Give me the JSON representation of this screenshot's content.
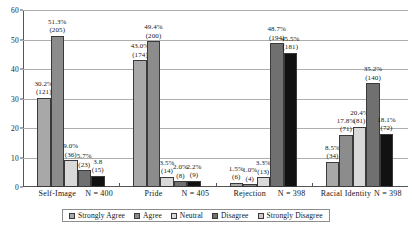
{
  "chart_data": {
    "type": "bar",
    "title": "",
    "subtitle": "",
    "xlabel": "",
    "ylabel": "",
    "ylim": [
      0,
      60
    ],
    "yticks": [
      0,
      10,
      20,
      30,
      40,
      50,
      60
    ],
    "grid": true,
    "legend_position": "bottom",
    "categories": [
      "Self-Image",
      "Pride",
      "Rejection",
      "Racial Identity"
    ],
    "category_n_labels": [
      "N = 400",
      "N = 405",
      "N = 398",
      "N = 398"
    ],
    "series": [
      {
        "name": "Strongly Agree",
        "color": "#a8a8a8",
        "values": [
          30.2,
          43.0,
          1.5,
          8.5
        ],
        "counts": [
          121,
          174,
          6,
          34
        ],
        "labels": [
          "30.2%",
          "43.0%",
          "1.5%",
          "8.5%"
        ],
        "count_labels": [
          "(121)",
          "(174)",
          "(6)",
          "(34)"
        ]
      },
      {
        "name": "Agree",
        "color": "#8c8c8c",
        "values": [
          51.3,
          49.4,
          1.0,
          17.8
        ],
        "counts": [
          205,
          200,
          4,
          71
        ],
        "labels": [
          "51.3%",
          "49.4%",
          "1.0%",
          "17.8%"
        ],
        "count_labels": [
          "(205)",
          "(200)",
          "(4)",
          "(71)"
        ]
      },
      {
        "name": "Neutral",
        "color": "#d9d9d9",
        "values": [
          9.0,
          3.5,
          3.3,
          20.4
        ],
        "counts": [
          36,
          14,
          13,
          81
        ],
        "labels": [
          "9.0%",
          "3.5%",
          "3.3%",
          "20.4%"
        ],
        "count_labels": [
          "(36)",
          "(14)",
          "(13)",
          "(81)"
        ]
      },
      {
        "name": "Disagree",
        "color": "#707070",
        "values": [
          5.7,
          2.0,
          48.7,
          35.2
        ],
        "counts": [
          23,
          8,
          194,
          140
        ],
        "labels": [
          "5.7%",
          "2.0%",
          "48.7%",
          "35.2%"
        ],
        "count_labels": [
          "(23)",
          "(8)",
          "(194)",
          "(140)"
        ]
      },
      {
        "name": "Strongly Disagree",
        "color": "#111111",
        "values": [
          3.8,
          2.2,
          45.5,
          18.1
        ],
        "counts": [
          15,
          9,
          181,
          72
        ],
        "labels": [
          "3.8",
          "2.2%",
          "45.5%",
          "18.1%"
        ],
        "count_labels": [
          "(15)",
          "(9)",
          "(181)",
          "(72)"
        ]
      }
    ]
  },
  "legend": {
    "items": [
      {
        "label": "Strongly Agree",
        "color": "#a8a8a8"
      },
      {
        "label": "Agree",
        "color": "#8c8c8c"
      },
      {
        "label": "Neutral",
        "color": "#d9d9d9"
      },
      {
        "label": "Disagree",
        "color": "#707070"
      },
      {
        "label": "Strongly Disagree",
        "color": "#c9c9c9"
      }
    ]
  }
}
